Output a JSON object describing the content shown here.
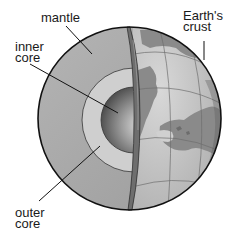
{
  "diagram": {
    "labels": {
      "mantle": "mantle",
      "inner_core": "inner\ncore",
      "outer_core": "outer\ncore",
      "crust": "Earth's\ncrust"
    },
    "colors": {
      "mantle": "#a9a9a9",
      "outer_core": "#cfcfcf",
      "inner_core_light": "#dcdcdc",
      "inner_core_dark": "#4a4a4a",
      "crust_band": "#6e6e6e",
      "ocean": "#bdbdbd",
      "land": "#8a8a8a",
      "outline": "#111111",
      "text": "#1a1a1a"
    }
  }
}
